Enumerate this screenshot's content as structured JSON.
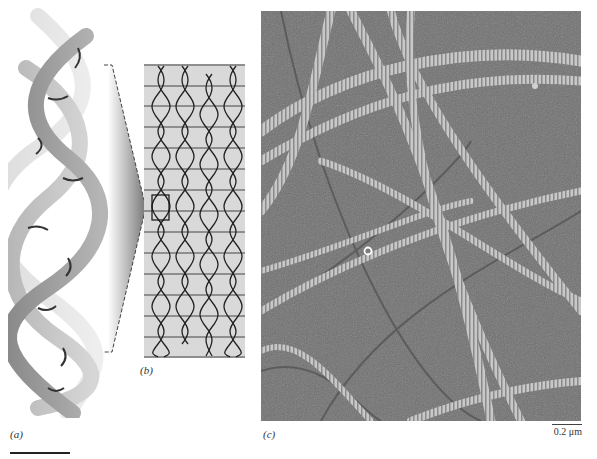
{
  "figure": {
    "panels": [
      {
        "id": "a",
        "label": "(a)",
        "description": "Triple-helix molecular model of collagen; three coiled polypeptide chains in shades of gray"
      },
      {
        "id": "b",
        "label": "(b)",
        "description": "Staggered array of collagen molecules in a fibril; horizontal lines mark the periodic banding; boxed region corresponds to enlarged model in (a)"
      },
      {
        "id": "c",
        "label": "(c)",
        "description": "Electron micrograph of banded collagen fibrils on a surface"
      }
    ],
    "scale_bar_c": "0.2 μm",
    "colors": {
      "background": "#ffffff",
      "panel_b_bg": "#d9d9d9",
      "micrograph_bg": "#6e6e6e",
      "fibril": "#bdbdbd",
      "ink": "#222222"
    }
  }
}
